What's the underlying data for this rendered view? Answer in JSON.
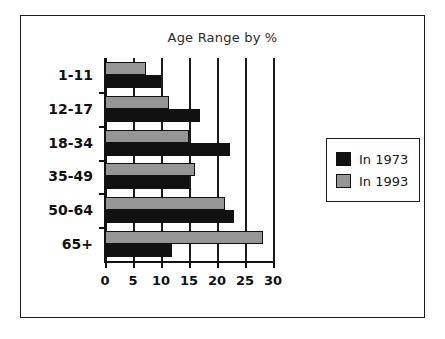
{
  "chart_data": {
    "type": "bar",
    "orientation": "horizontal",
    "title": "Age Range by %",
    "xlabel": "",
    "ylabel": "",
    "categories": [
      "1-11",
      "12-17",
      "18-34",
      "35-49",
      "50-64",
      "65+"
    ],
    "series": [
      {
        "name": "In 1973",
        "color": "#111111",
        "values": [
          10,
          17,
          22.3,
          15,
          23,
          12
        ]
      },
      {
        "name": "In 1993",
        "color": "#969696",
        "values": [
          7.3,
          11.5,
          15,
          16,
          21.5,
          28.3
        ]
      }
    ],
    "xlim": [
      0,
      30
    ],
    "xticks": [
      0,
      5,
      10,
      15,
      20,
      25,
      30
    ],
    "xtick_labels": [
      "0",
      "5",
      "10",
      "15",
      "20",
      "25",
      "30"
    ],
    "grid": true,
    "grid_axis": "x",
    "legend_position": "right-outside"
  },
  "legend": {
    "entries": [
      {
        "label": "In 1973",
        "swatch": "black-swatch"
      },
      {
        "label": "In 1993",
        "swatch": "gray-swatch"
      }
    ]
  },
  "colors": {
    "series_1973": "#111111",
    "series_1993": "#969696",
    "border": "#1a1a1a",
    "background": "#ffffff"
  }
}
